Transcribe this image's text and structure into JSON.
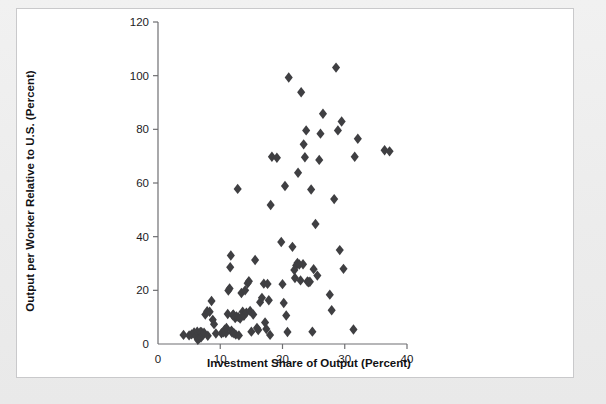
{
  "figure": {
    "panel_background": "#ffffff",
    "page_background": "#ececec",
    "border_color": "#c9c9cb"
  },
  "chart_data": {
    "type": "scatter",
    "title": "",
    "xlabel": "Investment Share of Output (Percent)",
    "ylabel": "Output per Worker Relative to U.S. (Percent)",
    "xlim": [
      0,
      40
    ],
    "ylim": [
      0,
      120
    ],
    "xticks": [
      0,
      10,
      20,
      30,
      40
    ],
    "yticks": [
      0,
      20,
      40,
      60,
      80,
      100,
      120
    ],
    "xtick_labels": [
      "0",
      "10",
      "20",
      "30",
      "40"
    ],
    "ytick_labels": [
      "0",
      "20",
      "40",
      "60",
      "80",
      "100",
      "120"
    ],
    "grid": false,
    "legend": null,
    "marker": {
      "shape": "diamond",
      "color": "#3f3f42",
      "size": 5.2
    },
    "series": [
      {
        "name": "Countries",
        "points": [
          [
            4.1,
            3.4
          ],
          [
            5.0,
            3.2
          ],
          [
            5.4,
            3.6
          ],
          [
            5.8,
            4.3
          ],
          [
            6.1,
            2.9
          ],
          [
            6.3,
            4.6
          ],
          [
            6.4,
            1.6
          ],
          [
            6.6,
            2.1
          ],
          [
            6.8,
            4.5
          ],
          [
            6.9,
            2.4
          ],
          [
            7.0,
            4.4
          ],
          [
            7.2,
            3.3
          ],
          [
            7.4,
            4.2
          ],
          [
            7.6,
            11.0
          ],
          [
            7.9,
            12.2
          ],
          [
            8.0,
            3.1
          ],
          [
            8.3,
            12.0
          ],
          [
            8.6,
            16.0
          ],
          [
            8.8,
            9.0
          ],
          [
            9.0,
            7.4
          ],
          [
            9.3,
            3.9
          ],
          [
            10.2,
            4.0
          ],
          [
            10.5,
            4.4
          ],
          [
            10.7,
            5.3
          ],
          [
            10.9,
            4.1
          ],
          [
            11.0,
            6.0
          ],
          [
            11.2,
            11.2
          ],
          [
            11.3,
            19.9
          ],
          [
            11.5,
            20.7
          ],
          [
            11.6,
            28.6
          ],
          [
            11.7,
            33.0
          ],
          [
            11.8,
            5.0
          ],
          [
            11.9,
            4.3
          ],
          [
            12.0,
            10.7
          ],
          [
            12.1,
            11.0
          ],
          [
            12.2,
            4.0
          ],
          [
            12.4,
            9.7
          ],
          [
            12.5,
            3.5
          ],
          [
            12.6,
            10.3
          ],
          [
            12.8,
            57.8
          ],
          [
            12.9,
            10.0
          ],
          [
            13.0,
            3.2
          ],
          [
            13.2,
            9.5
          ],
          [
            13.4,
            19.0
          ],
          [
            13.6,
            12.0
          ],
          [
            13.8,
            10.5
          ],
          [
            14.0,
            20.0
          ],
          [
            14.2,
            11.7
          ],
          [
            14.4,
            22.6
          ],
          [
            14.6,
            23.4
          ],
          [
            14.8,
            12.3
          ],
          [
            15.0,
            4.6
          ],
          [
            15.3,
            11.0
          ],
          [
            15.6,
            31.3
          ],
          [
            15.9,
            6.0
          ],
          [
            16.1,
            5.2
          ],
          [
            16.4,
            15.6
          ],
          [
            16.7,
            17.2
          ],
          [
            17.0,
            22.5
          ],
          [
            17.2,
            8.0
          ],
          [
            17.4,
            5.6
          ],
          [
            17.6,
            22.4
          ],
          [
            17.8,
            16.3
          ],
          [
            18.0,
            3.4
          ],
          [
            18.1,
            51.8
          ],
          [
            18.3,
            69.8
          ],
          [
            19.1,
            69.4
          ],
          [
            19.8,
            38.0
          ],
          [
            20.0,
            22.3
          ],
          [
            20.2,
            15.3
          ],
          [
            20.4,
            58.9
          ],
          [
            20.6,
            10.6
          ],
          [
            20.8,
            4.5
          ],
          [
            21.0,
            99.3
          ],
          [
            21.6,
            36.2
          ],
          [
            21.9,
            27.6
          ],
          [
            22.0,
            24.6
          ],
          [
            22.2,
            29.3
          ],
          [
            22.4,
            30.2
          ],
          [
            22.5,
            63.8
          ],
          [
            22.7,
            29.6
          ],
          [
            22.9,
            23.7
          ],
          [
            23.0,
            93.8
          ],
          [
            23.3,
            29.7
          ],
          [
            23.4,
            74.4
          ],
          [
            23.6,
            69.6
          ],
          [
            23.8,
            79.6
          ],
          [
            24.0,
            23.3
          ],
          [
            24.2,
            23.0
          ],
          [
            24.4,
            23.2
          ],
          [
            24.6,
            57.6
          ],
          [
            24.8,
            4.6
          ],
          [
            25.0,
            27.9
          ],
          [
            25.3,
            44.7
          ],
          [
            25.6,
            25.5
          ],
          [
            25.9,
            68.6
          ],
          [
            26.1,
            78.4
          ],
          [
            26.5,
            85.8
          ],
          [
            27.6,
            18.4
          ],
          [
            27.9,
            12.6
          ],
          [
            28.3,
            54.0
          ],
          [
            28.6,
            103.0
          ],
          [
            28.9,
            79.6
          ],
          [
            29.2,
            35.0
          ],
          [
            29.5,
            82.9
          ],
          [
            29.8,
            28.0
          ],
          [
            31.4,
            5.4
          ],
          [
            31.6,
            69.8
          ],
          [
            32.1,
            76.5
          ],
          [
            36.4,
            72.2
          ],
          [
            37.2,
            71.8
          ]
        ]
      }
    ]
  }
}
